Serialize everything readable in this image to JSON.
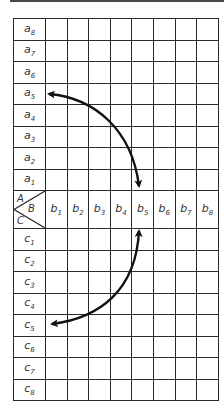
{
  "figure": {
    "corner_labels": {
      "a": "A",
      "b": "B",
      "c": "C"
    },
    "a_rows": [
      {
        "base": "a",
        "sub": "8"
      },
      {
        "base": "a",
        "sub": "7"
      },
      {
        "base": "a",
        "sub": "6"
      },
      {
        "base": "a",
        "sub": "5"
      },
      {
        "base": "a",
        "sub": "4"
      },
      {
        "base": "a",
        "sub": "3"
      },
      {
        "base": "a",
        "sub": "2"
      },
      {
        "base": "a",
        "sub": "1"
      }
    ],
    "b_cols": [
      {
        "base": "b",
        "sub": "1"
      },
      {
        "base": "b",
        "sub": "2"
      },
      {
        "base": "b",
        "sub": "3"
      },
      {
        "base": "b",
        "sub": "4"
      },
      {
        "base": "b",
        "sub": "5"
      },
      {
        "base": "b",
        "sub": "6"
      },
      {
        "base": "b",
        "sub": "7"
      },
      {
        "base": "b",
        "sub": "8"
      }
    ],
    "c_rows": [
      {
        "base": "c",
        "sub": "1"
      },
      {
        "base": "c",
        "sub": "2"
      },
      {
        "base": "c",
        "sub": "3"
      },
      {
        "base": "c",
        "sub": "4"
      },
      {
        "base": "c",
        "sub": "5"
      },
      {
        "base": "c",
        "sub": "6"
      },
      {
        "base": "c",
        "sub": "7"
      },
      {
        "base": "c",
        "sub": "8"
      }
    ],
    "arrows": [
      {
        "from": "a5",
        "to": "b5",
        "bidirectional": true
      },
      {
        "from": "b5",
        "to": "c5",
        "bidirectional": true
      }
    ],
    "colors": {
      "line": "#2a2a2a",
      "arrow": "#111111",
      "text": "#333333"
    }
  }
}
